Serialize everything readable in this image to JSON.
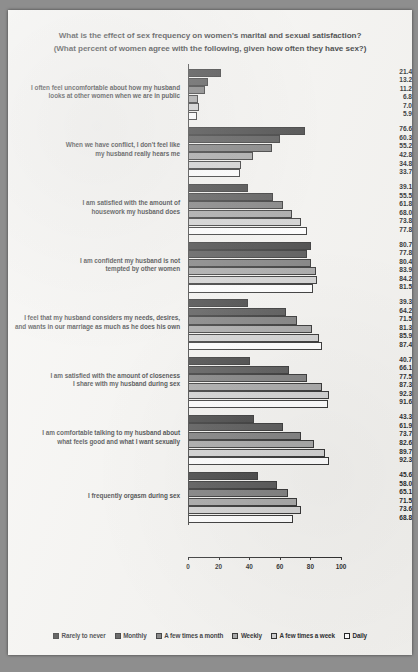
{
  "title": {
    "line1": "What is the effect of sex frequency on women's marital and sexual satisfaction?",
    "line2": "(What percent of women agree with the following, given how often they have sex?)"
  },
  "legend": {
    "position": "bottom-center",
    "items": [
      {
        "label": "Rarely to never",
        "color": "#2b2b2b"
      },
      {
        "label": "Monthly",
        "color": "#3f3f3f"
      },
      {
        "label": "A few times a month",
        "color": "#6e6e6e"
      },
      {
        "label": "Weekly",
        "color": "#9c9c9c"
      },
      {
        "label": "A few times a week",
        "color": "#cdcdcd"
      },
      {
        "label": "Daily",
        "color": "#ffffff"
      }
    ]
  },
  "axis": {
    "ticks": [
      "0",
      "20",
      "40",
      "60",
      "80",
      "100"
    ]
  },
  "chart_data": {
    "type": "bar",
    "orientation": "horizontal",
    "title": "What is the effect of sex frequency on women's marital and sexual satisfaction? (What percent of women agree with the following, given how often they have sex?)",
    "xlabel": "",
    "ylabel": "",
    "xlim": [
      0,
      100
    ],
    "grid": false,
    "legend_position": "bottom-center",
    "categories": [
      "I often feel uncomfortable about how my husband looks at other women when we are in public",
      "When we have conflict, I don't feel like my husband really hears me",
      "I am satisfied with the amount of housework my husband does",
      "I am confident my husband is not tempted by other women",
      "I feel that my husband considers my needs, desires, and wants in our marriage as much as he does his own",
      "I am satisfied with the amount of closeness I share with my husband during sex",
      "I am comfortable talking to my husband about what feels good and what I want sexually",
      "I frequently orgasm during sex"
    ],
    "series": [
      {
        "name": "Rarely to never",
        "values": [
          21.4,
          76.6,
          39.1,
          80.7,
          39.3,
          40.7,
          43.3,
          45.6
        ]
      },
      {
        "name": "Monthly",
        "values": [
          13.2,
          60.3,
          55.5,
          77.8,
          64.2,
          66.1,
          61.9,
          58.0
        ]
      },
      {
        "name": "A few times a month",
        "values": [
          11.2,
          55.2,
          61.8,
          80.4,
          71.5,
          77.5,
          73.7,
          65.1
        ]
      },
      {
        "name": "Weekly",
        "values": [
          6.8,
          42.8,
          68.0,
          83.9,
          81.3,
          87.3,
          82.6,
          71.5
        ]
      },
      {
        "name": "A few times a week",
        "values": [
          7.0,
          34.8,
          73.8,
          84.2,
          85.9,
          92.3,
          89.7,
          73.6
        ]
      },
      {
        "name": "Daily",
        "values": [
          5.9,
          33.7,
          77.8,
          81.5,
          87.4,
          91.6,
          92.3,
          68.8
        ]
      }
    ]
  },
  "groups": [
    {
      "label_lines": [
        "I often feel uncomfortable about how my husband",
        "looks at other women when we are in public"
      ],
      "values": [
        "21.4",
        "13.2",
        "11.2",
        "6.8",
        "7.0",
        "5.9"
      ]
    },
    {
      "label_lines": [
        "When we have conflict, I don't feel like",
        "my husband really hears me"
      ],
      "values": [
        "76.6",
        "60.3",
        "55.2",
        "42.8",
        "34.8",
        "33.7"
      ]
    },
    {
      "label_lines": [
        "I am satisfied with the amount of",
        "housework my husband does"
      ],
      "values": [
        "39.1",
        "55.5",
        "61.8",
        "68.0",
        "73.8",
        "77.8"
      ]
    },
    {
      "label_lines": [
        "I am confident my husband is not",
        "tempted by other women"
      ],
      "values": [
        "80.7",
        "77.8",
        "80.4",
        "83.9",
        "84.2",
        "81.5"
      ]
    },
    {
      "label_lines": [
        "I feel that my husband considers my needs, desires,",
        "and wants in our marriage as much as he does his own"
      ],
      "values": [
        "39.3",
        "64.2",
        "71.5",
        "81.3",
        "85.9",
        "87.4"
      ]
    },
    {
      "label_lines": [
        "I am satisfied with the amount of closeness",
        "I share with my husband during sex"
      ],
      "values": [
        "40.7",
        "66.1",
        "77.5",
        "87.3",
        "92.3",
        "91.6"
      ]
    },
    {
      "label_lines": [
        "I am comfortable talking to my husband about",
        "what feels good and what I want sexually"
      ],
      "values": [
        "43.3",
        "61.9",
        "73.7",
        "82.6",
        "89.7",
        "92.3"
      ]
    },
    {
      "label_lines": [
        "I frequently orgasm during sex"
      ],
      "values": [
        "45.6",
        "58.0",
        "65.1",
        "71.5",
        "73.6",
        "68.8"
      ]
    }
  ]
}
